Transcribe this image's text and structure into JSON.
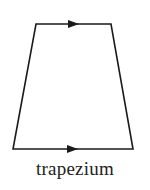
{
  "diagram": {
    "shape": "trapezium",
    "caption": "trapezium",
    "stroke_color": "#1a1a1a",
    "vertices": {
      "top_left": [
        36,
        24
      ],
      "top_right": [
        111,
        24
      ],
      "bottom_right": [
        133,
        149
      ],
      "bottom_left": [
        13,
        149
      ]
    },
    "parallel_markers": [
      {
        "edge": "top",
        "symbol": "single-arrow",
        "direction": "right"
      },
      {
        "edge": "bottom",
        "symbol": "single-arrow",
        "direction": "right"
      }
    ]
  }
}
